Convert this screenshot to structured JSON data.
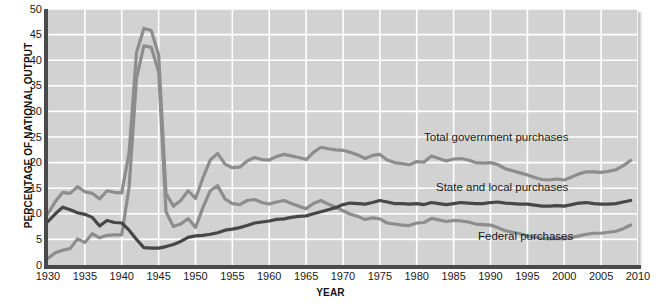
{
  "chart_data": {
    "type": "line",
    "title": "",
    "xlabel": "YEAR",
    "ylabel": "PERCENTAGE OF NATIONAL OUTPUT",
    "xlim": [
      1930,
      2010
    ],
    "ylim": [
      0,
      50
    ],
    "xticks": [
      1930,
      1935,
      1940,
      1945,
      1950,
      1955,
      1960,
      1965,
      1970,
      1975,
      1980,
      1985,
      1990,
      1995,
      2000,
      2005,
      2010
    ],
    "yticks": [
      0,
      5,
      10,
      15,
      20,
      25,
      30,
      35,
      40,
      45,
      50
    ],
    "grid": true,
    "legend_position": "inline-annotations",
    "x": [
      1930,
      1931,
      1932,
      1933,
      1934,
      1935,
      1936,
      1937,
      1938,
      1939,
      1940,
      1941,
      1942,
      1943,
      1944,
      1945,
      1946,
      1947,
      1948,
      1949,
      1950,
      1951,
      1952,
      1953,
      1954,
      1955,
      1956,
      1957,
      1958,
      1959,
      1960,
      1961,
      1962,
      1963,
      1964,
      1965,
      1966,
      1967,
      1968,
      1969,
      1970,
      1971,
      1972,
      1973,
      1974,
      1975,
      1976,
      1977,
      1978,
      1979,
      1980,
      1981,
      1982,
      1983,
      1984,
      1985,
      1986,
      1987,
      1988,
      1989,
      1990,
      1991,
      1992,
      1993,
      1994,
      1995,
      1996,
      1997,
      1998,
      1999,
      2000,
      2001,
      2002,
      2003,
      2004,
      2005,
      2006,
      2007,
      2008,
      2009
    ],
    "series": [
      {
        "name": "Total government purchases",
        "color": "#8d8d8d",
        "values": [
          10.0,
          12.4,
          14.2,
          14.0,
          15.3,
          14.3,
          14.0,
          12.9,
          14.5,
          14.2,
          14.1,
          22.0,
          41.5,
          46.2,
          45.8,
          41.0,
          14.0,
          11.5,
          12.6,
          14.5,
          13.0,
          17.0,
          20.5,
          21.8,
          19.7,
          19.0,
          19.1,
          20.3,
          21.0,
          20.6,
          20.5,
          21.2,
          21.6,
          21.3,
          21.0,
          20.6,
          22.0,
          23.0,
          22.7,
          22.5,
          22.4,
          22.0,
          21.5,
          20.8,
          21.4,
          21.6,
          20.5,
          20.0,
          19.8,
          19.6,
          20.2,
          20.1,
          21.3,
          20.8,
          20.3,
          20.7,
          20.8,
          20.5,
          20.0,
          19.9,
          20.0,
          19.6,
          18.8,
          18.4,
          18.0,
          17.6,
          17.1,
          16.7,
          16.6,
          16.8,
          16.6,
          17.2,
          17.8,
          18.2,
          18.2,
          18.1,
          18.3,
          18.6,
          19.4,
          20.4
        ]
      },
      {
        "name": "State and local purchases",
        "color": "#474747",
        "values": [
          8.5,
          10.0,
          11.3,
          10.8,
          10.2,
          9.9,
          9.3,
          7.6,
          8.7,
          8.3,
          8.2,
          6.8,
          5.0,
          3.4,
          3.3,
          3.3,
          3.6,
          4.0,
          4.6,
          5.4,
          5.7,
          5.8,
          6.0,
          6.3,
          6.8,
          7.0,
          7.3,
          7.7,
          8.2,
          8.4,
          8.6,
          8.9,
          9.0,
          9.3,
          9.5,
          9.6,
          10.0,
          10.4,
          10.8,
          11.2,
          11.8,
          12.1,
          12.0,
          11.9,
          12.2,
          12.6,
          12.3,
          12.0,
          12.0,
          11.9,
          12.0,
          11.8,
          12.2,
          12.0,
          11.8,
          12.0,
          12.2,
          12.1,
          12.0,
          12.0,
          12.2,
          12.3,
          12.1,
          12.0,
          11.9,
          11.9,
          11.7,
          11.5,
          11.5,
          11.6,
          11.5,
          11.8,
          12.1,
          12.2,
          12.0,
          11.9,
          11.9,
          12.0,
          12.3,
          12.6
        ]
      },
      {
        "name": "Federal purchases",
        "color": "#8d8d8d",
        "values": [
          1.3,
          2.4,
          2.9,
          3.2,
          5.1,
          4.4,
          6.1,
          5.3,
          5.8,
          5.9,
          5.9,
          15.2,
          36.5,
          42.8,
          42.5,
          37.7,
          10.4,
          7.5,
          8.0,
          9.1,
          7.3,
          11.2,
          14.5,
          15.5,
          12.9,
          12.0,
          11.8,
          12.6,
          12.8,
          12.2,
          11.9,
          12.3,
          12.6,
          12.0,
          11.5,
          11.0,
          12.0,
          12.6,
          11.9,
          11.3,
          10.6,
          9.9,
          9.5,
          8.9,
          9.2,
          9.0,
          8.2,
          8.0,
          7.8,
          7.7,
          8.2,
          8.3,
          9.1,
          8.8,
          8.5,
          8.7,
          8.6,
          8.4,
          8.0,
          7.9,
          7.8,
          7.3,
          6.7,
          6.4,
          6.1,
          5.7,
          5.4,
          5.2,
          5.1,
          5.2,
          5.1,
          5.4,
          5.7,
          6.0,
          6.2,
          6.2,
          6.4,
          6.6,
          7.1,
          7.8
        ]
      }
    ]
  },
  "axis": {
    "y_title": "PERCENTAGE OF NATIONAL OUTPUT",
    "x_title": "YEAR",
    "y_tick_labels": [
      "50",
      "45",
      "40",
      "35",
      "30",
      "25",
      "20",
      "15",
      "10",
      "5",
      "0"
    ],
    "x_tick_labels": [
      "1930",
      "1935",
      "1940",
      "1945",
      "1950",
      "1955",
      "1960",
      "1965",
      "1970",
      "1975",
      "1980",
      "1985",
      "1990",
      "1995",
      "2000",
      "2005",
      "2010"
    ]
  },
  "annotations": {
    "total": "Total government purchases",
    "state_local": "State and local purchases",
    "federal": "Federal purchases"
  },
  "colors": {
    "plot_background": "#d2d2d2",
    "gridline": "#ffffff",
    "axis": "#4a4a4a",
    "light_series": "#8d8d8d",
    "dark_series": "#474747",
    "page_background": "#ffffff"
  }
}
